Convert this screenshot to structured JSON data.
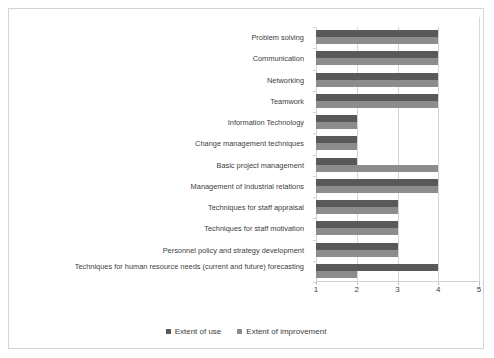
{
  "chart_data": {
    "type": "bar",
    "orientation": "horizontal",
    "title": "",
    "xlabel": "",
    "ylabel": "",
    "xlim": [
      1,
      5
    ],
    "xticks": [
      1,
      2,
      3,
      4,
      5
    ],
    "grid": true,
    "legend_position": "bottom",
    "categories": [
      "Problem solving",
      "Communication",
      "Networking",
      "Teamwork",
      "Information Technology",
      "Change management techniques",
      "Basic project management",
      "Management of Industrial relations",
      "Techniques for staff appraisal",
      "Techniques for staff motivation",
      "Personnel policy and strategy development",
      "Techniques for human resource needs (current and future) forecasting"
    ],
    "series": [
      {
        "name": "Extent of use",
        "color": "#595959",
        "values": [
          4,
          4,
          4,
          4,
          2,
          2,
          2,
          4,
          3,
          3,
          3,
          4
        ]
      },
      {
        "name": "Extent of improvement",
        "color": "#8c8c8c",
        "values": [
          4,
          4,
          4,
          4,
          2,
          2,
          4,
          4,
          3,
          3,
          3,
          2
        ]
      }
    ]
  },
  "legend": {
    "items": [
      {
        "label": "Extent of use",
        "color": "#595959"
      },
      {
        "label": "Extent of improvement",
        "color": "#8c8c8c"
      }
    ]
  },
  "axis": {
    "tick_labels": [
      "1",
      "2",
      "3",
      "4",
      "5"
    ]
  }
}
